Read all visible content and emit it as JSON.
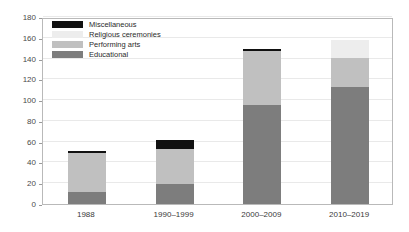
{
  "chart_data": {
    "type": "bar",
    "stacked": true,
    "title": "",
    "subtitle": "",
    "xlabel": "",
    "ylabel": "",
    "categories": [
      "1988",
      "1990–1999",
      "2000–2009",
      "2010–2019"
    ],
    "series": [
      {
        "name": "Educational",
        "color": "#7d7d7d",
        "values": [
          12,
          19,
          95,
          113
        ]
      },
      {
        "name": "Performing arts",
        "color": "#c0c0c0",
        "values": [
          37,
          34,
          52,
          28
        ]
      },
      {
        "name": "Religious ceremonies",
        "color": "#ededed",
        "values": [
          0,
          0,
          0,
          17
        ]
      },
      {
        "name": "Miscellaneous",
        "color": "#111111",
        "values": [
          2,
          9,
          2,
          0
        ]
      }
    ],
    "totals": [
      51,
      62,
      149,
      158
    ],
    "ylim": [
      0,
      180
    ],
    "yticks": [
      0,
      20,
      40,
      60,
      80,
      100,
      120,
      140,
      160,
      180
    ],
    "ytick_labels": [
      "0",
      "20",
      "40",
      "60",
      "80",
      "100",
      "120",
      "140",
      "160",
      "180"
    ],
    "grid": true,
    "grid_axis": "y",
    "legend_position": "top-left",
    "legend_entries": [
      "Miscellaneous",
      "Religious ceremonies",
      "Performing arts",
      "Educational"
    ],
    "legend_colors": [
      "#111111",
      "#ededed",
      "#c0c0c0",
      "#7d7d7d"
    ]
  }
}
